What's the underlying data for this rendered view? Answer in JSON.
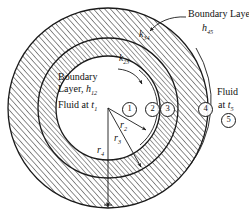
{
  "figure": {
    "title_hidden": "Composite cylindrical wall with fluid boundary layers",
    "labels": {
      "boundary_layer_outer": "Boundary Layer",
      "h45": "h",
      "h45_sub": "45",
      "k34": "k",
      "k34_sub": "34",
      "k23": "k",
      "k23_sub": "23",
      "boundary_layer_inner_line1": "Boundary",
      "boundary_layer_inner_line2": "Layer, ",
      "h12": "h",
      "h12_sub": "12",
      "fluid_inner": "Fluid at ",
      "t1": "t",
      "t1_sub": "1",
      "fluid_outer_line1": "Fluid",
      "fluid_outer_line2": "at ",
      "t5": "t",
      "t5_sub": "5",
      "r2": "r",
      "r2_sub": "2",
      "r3": "r",
      "r3_sub": "3",
      "r4": "r",
      "r4_sub": "4"
    },
    "station_numbers": [
      "1",
      "2",
      "3",
      "4",
      "5"
    ],
    "colors": {
      "ink": "#1a1a1a",
      "hatch": "#2b2b2b",
      "paper": "#ffffff"
    },
    "geometry": {
      "center_x": 108,
      "center_y": 108,
      "r1_inner_fluid": 47,
      "r2_wall_inner": 52,
      "r3_wall_mid": 70,
      "r4_wall_outer": 100,
      "r5_boundary_outer": 104
    }
  }
}
